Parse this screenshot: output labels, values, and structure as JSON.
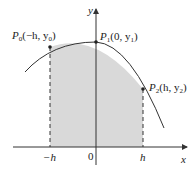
{
  "diagram": {
    "axes": {
      "x_label": "x",
      "y_label": "y",
      "origin_label": "0"
    },
    "ticks": {
      "neg_h": "−h",
      "pos_h": "h"
    },
    "points": [
      {
        "id": "P0",
        "label": "P",
        "sub": "0",
        "coords": "(−h, y",
        "coord_sub": "0",
        "close": ")"
      },
      {
        "id": "P1",
        "label": "P",
        "sub": "1",
        "coords": "(0, y",
        "coord_sub": "1",
        "close": ")"
      },
      {
        "id": "P2",
        "label": "P",
        "sub": "2",
        "coords": "(h, y",
        "coord_sub": "2",
        "close": ")"
      }
    ],
    "colors": {
      "shade": "#d9d9d9",
      "curve": "#333333",
      "axis": "#333333"
    }
  }
}
